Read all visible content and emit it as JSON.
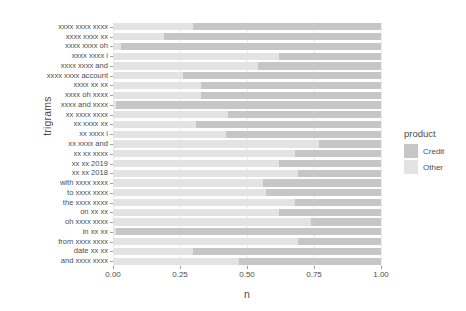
{
  "chart_data": {
    "type": "bar",
    "title": "",
    "subtitle": "",
    "xlabel": "n",
    "ylabel": "trigrams",
    "orientation": "horizontal",
    "stacked": true,
    "stack_normalized": true,
    "xlim": [
      0,
      1
    ],
    "xticks": [
      0.0,
      0.25,
      0.5,
      0.75,
      1.0
    ],
    "xticklabels": [
      "0.00",
      "0.25",
      "0.50",
      "0.75",
      "1.00"
    ],
    "grid": "vertical-major-only",
    "legend": {
      "title": "product",
      "position": "right",
      "entries": [
        {
          "label": "Credit",
          "color": "#c6c6c6"
        },
        {
          "label": "Other",
          "color": "#e3e3e3"
        }
      ]
    },
    "categories": [
      "xxxx xxxx xxxx",
      "xxxx xxxx xx",
      "xxxx xxxx oh",
      "xxxx xxxx i",
      "xxxx xxxx and",
      "xxxx xxxx account",
      "xxxx xx xx",
      "xxxx oh xxxx",
      "xxxx and xxxx",
      "xx xxxx xxxx",
      "xx xxxx xx",
      "xx xxxx i",
      "xx xxxx and",
      "xx xx xxxx",
      "xx xx 2019",
      "xx xx 2018",
      "with xxxx xxxx",
      "to xxxx xxxx",
      "the xxxx xxxx",
      "on xx xx",
      "oh xxxx xxxx",
      "in xx xx",
      "from xxxx xxxx",
      "date xx xx",
      "and xxxx xxxx"
    ],
    "series": [
      {
        "name": "Other",
        "color": "#e3e3e3",
        "values": [
          0.3,
          0.19,
          0.03,
          0.62,
          0.54,
          0.26,
          0.33,
          0.33,
          0.01,
          0.43,
          0.31,
          0.42,
          0.77,
          0.68,
          0.62,
          0.69,
          0.56,
          0.57,
          0.68,
          0.62,
          0.74,
          0.01,
          0.69,
          0.3,
          0.47
        ]
      },
      {
        "name": "Credit",
        "color": "#c6c6c6",
        "values": [
          0.7,
          0.81,
          0.97,
          0.38,
          0.46,
          0.74,
          0.67,
          0.67,
          0.99,
          0.57,
          0.69,
          0.58,
          0.23,
          0.32,
          0.38,
          0.31,
          0.44,
          0.43,
          0.32,
          0.38,
          0.26,
          0.99,
          0.31,
          0.7,
          0.53
        ]
      }
    ]
  },
  "colors": {
    "panel_background": "#ffffff",
    "grid": "#ebebeb",
    "text": "#4d4d4d",
    "axis_tick": "#a0a0a0",
    "credit": "#c6c6c6",
    "other": "#e3e3e3"
  }
}
